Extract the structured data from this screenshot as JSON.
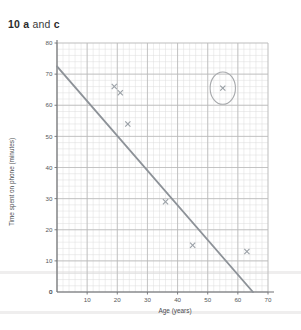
{
  "question": {
    "number": "10",
    "part": "a",
    "conjunction": "and",
    "part2": "c"
  },
  "chart_data": {
    "type": "scatter",
    "title": "",
    "xlabel": "Age (years)",
    "ylabel": "Time spent on phone (minutes)",
    "xlim": [
      0,
      70
    ],
    "ylim": [
      0,
      80
    ],
    "xticks": [
      0,
      10,
      20,
      30,
      40,
      50,
      60,
      70
    ],
    "yticks": [
      0,
      10,
      20,
      30,
      40,
      50,
      60,
      70,
      80
    ],
    "xtick_labels": [
      "0",
      "10",
      "20",
      "30",
      "40",
      "50",
      "60",
      "70"
    ],
    "ytick_labels": [
      "0",
      "10",
      "20",
      "30",
      "40",
      "50",
      "60",
      "70",
      "80"
    ],
    "grid": true,
    "grid_minor_step": 2,
    "legend": "none",
    "points": [
      {
        "x": 19,
        "y": 66
      },
      {
        "x": 21,
        "y": 64
      },
      {
        "x": 23.5,
        "y": 54
      },
      {
        "x": 36,
        "y": 29
      },
      {
        "x": 45,
        "y": 15
      },
      {
        "x": 55,
        "y": 65.5
      },
      {
        "x": 63,
        "y": 13
      }
    ],
    "series": [
      {
        "name": "line of best fit",
        "type": "line",
        "points": [
          {
            "x": 0,
            "y": 72.5
          },
          {
            "x": 65,
            "y": 0
          }
        ]
      }
    ],
    "annotations": [
      {
        "type": "ellipse",
        "name": "outlier-ring",
        "cx": 55,
        "cy": 65.5,
        "rx": 4.2,
        "ry": 5.2
      }
    ],
    "colors": {
      "marker": "#9aa0a6",
      "trend_line": "#8d9298",
      "grid_major": "#b9b9b9",
      "grid_minor": "#dcdcdc",
      "axis": "#6f7174",
      "annotation": "#a7a9ac",
      "page_rule": "#efeeee"
    }
  }
}
